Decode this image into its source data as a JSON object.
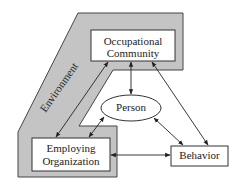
{
  "diagram": {
    "environment_label": "Environment",
    "nodes": {
      "occupational": {
        "line1": "Occupational",
        "line2": "Community"
      },
      "person": {
        "label": "Person"
      },
      "employing": {
        "line1": "Employing",
        "line2": "Organization"
      },
      "behavior": {
        "label": "Behavior"
      }
    },
    "edges": [
      {
        "from": "Occupational Community",
        "to": "Employing Organization",
        "type": "bidirectional"
      },
      {
        "from": "Occupational Community",
        "to": "Person",
        "type": "bidirectional"
      },
      {
        "from": "Occupational Community",
        "to": "Behavior",
        "type": "bidirectional"
      },
      {
        "from": "Person",
        "to": "Employing Organization",
        "type": "bidirectional"
      },
      {
        "from": "Person",
        "to": "Behavior",
        "type": "bidirectional"
      },
      {
        "from": "Employing Organization",
        "to": "Behavior",
        "type": "bidirectional"
      }
    ],
    "colors": {
      "environment_fill": "#c4c4c4",
      "stroke": "#333333",
      "box_fill": "#ffffff"
    }
  }
}
